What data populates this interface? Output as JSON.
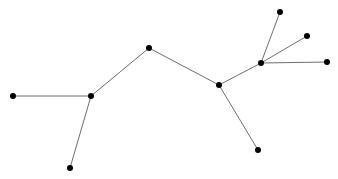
{
  "diagram": {
    "type": "tree-graph",
    "width": 338,
    "height": 179,
    "colors": {
      "background": "#ffffff",
      "edge": "#6e6e6e",
      "node": "#000000"
    },
    "node_radius": 3,
    "nodes": [
      {
        "id": "A",
        "x": 13,
        "y": 96
      },
      {
        "id": "B",
        "x": 91,
        "y": 96
      },
      {
        "id": "C",
        "x": 70,
        "y": 168
      },
      {
        "id": "D",
        "x": 149,
        "y": 48
      },
      {
        "id": "E",
        "x": 219,
        "y": 85
      },
      {
        "id": "F",
        "x": 258,
        "y": 150
      },
      {
        "id": "G",
        "x": 261,
        "y": 63
      },
      {
        "id": "H",
        "x": 280,
        "y": 12
      },
      {
        "id": "I",
        "x": 307,
        "y": 36
      },
      {
        "id": "J",
        "x": 327,
        "y": 62
      }
    ],
    "edges": [
      {
        "from": "A",
        "to": "B"
      },
      {
        "from": "B",
        "to": "C"
      },
      {
        "from": "B",
        "to": "D"
      },
      {
        "from": "D",
        "to": "E"
      },
      {
        "from": "E",
        "to": "F"
      },
      {
        "from": "E",
        "to": "G"
      },
      {
        "from": "G",
        "to": "H"
      },
      {
        "from": "G",
        "to": "I"
      },
      {
        "from": "G",
        "to": "J"
      }
    ]
  }
}
